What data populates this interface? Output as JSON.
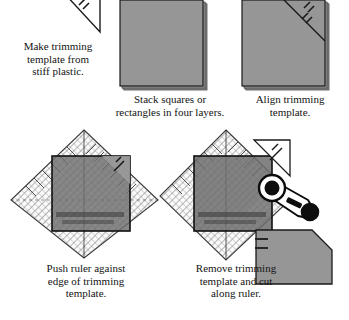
{
  "document": {
    "title": "Trimming squares with a plastic template and ruler",
    "type": "sewing-instruction-diagram",
    "panel_count": 5
  },
  "palette": {
    "fabric_gray": "#969696",
    "fabric_gray_dark": "#7d7d7d",
    "fabric_shadow": "#4a4a4a",
    "outline": "#1a1a1a",
    "ruler_line": "#6b6b6b",
    "white": "#ffffff",
    "text": "#141414"
  },
  "steps": [
    {
      "number": 1,
      "caption": "Make trimming\ntemplate from\nstiff plastic.",
      "art_name": "plastic-triangle-template",
      "elements": [
        "right-triangle outline",
        "three hatch tick marks"
      ]
    },
    {
      "number": 2,
      "caption": "Stack squares or\nrectangles in four layers.",
      "art_name": "stacked-fabric-squares",
      "layer_count": 4,
      "elements": [
        "gray square",
        "stacked edge shadows"
      ]
    },
    {
      "number": 3,
      "caption": "Align trimming\ntemplate.",
      "art_name": "template-aligned-on-stack",
      "elements": [
        "gray square",
        "diagonal template line across top-right corner",
        "hatch tick marks"
      ]
    },
    {
      "number": 4,
      "caption": "Push ruler against\nedge of trimming\ntemplate.",
      "art_name": "ruler-against-template",
      "elements": [
        "diamond ruler with grid hatching",
        "ruler markings",
        "fabric stack",
        "trimming template corner"
      ]
    },
    {
      "number": 5,
      "caption": "Remove trimming\ntemplate and cut\nalong ruler.",
      "art_name": "cut-along-ruler",
      "elements": [
        "diamond ruler",
        "fabric stack",
        "removed plastic template",
        "rotary cutter",
        "equals sign",
        "finished trimmed pentagon"
      ]
    }
  ],
  "result": {
    "label": "=",
    "shape_name": "trimmed-pentagon",
    "description": "square with top-right corner cut off"
  },
  "tools": {
    "rotary_cutter": "rotary-cutter",
    "ruler": "quilting-ruler",
    "template": "plastic-trimming-template"
  }
}
